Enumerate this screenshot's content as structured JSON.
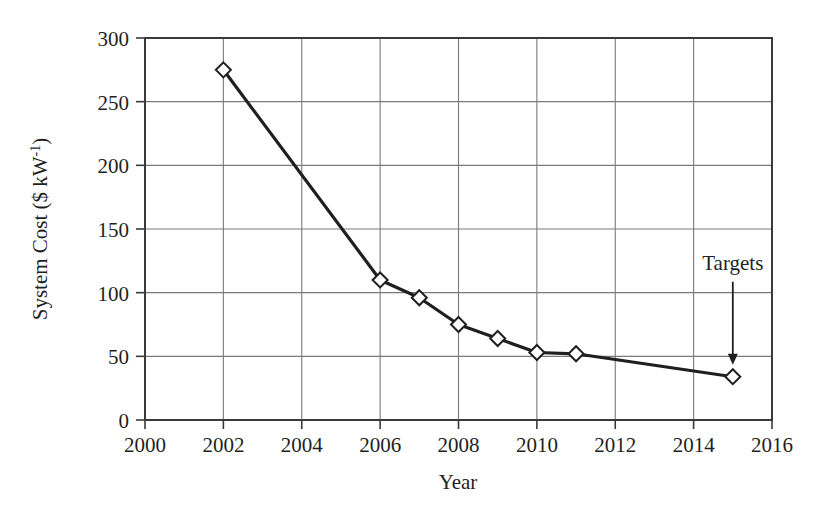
{
  "figure": {
    "background_color": "#ffffff",
    "ink_color": "#1f1f1f",
    "grid_color": "#7a7a7a",
    "frame_color": "#3a3a3a"
  },
  "chart_data": {
    "type": "line",
    "title": "",
    "xlabel": "Year",
    "ylabel_text": "System Cost ($ kW",
    "ylabel_sup": "-1",
    "ylabel_tail": ")",
    "ylabel_full": "System Cost ($ kW⁻¹)",
    "xlim": [
      2000,
      2016
    ],
    "ylim": [
      0,
      300
    ],
    "xticks": [
      2000,
      2002,
      2004,
      2006,
      2008,
      2010,
      2012,
      2014,
      2016
    ],
    "xtick_labels": [
      "2000",
      "2002",
      "2004",
      "2006",
      "2008",
      "2010",
      "2012",
      "2014",
      "2016"
    ],
    "yticks": [
      0,
      50,
      100,
      150,
      200,
      250,
      300
    ],
    "ytick_labels": [
      "0",
      "50",
      "100",
      "150",
      "200",
      "250",
      "300"
    ],
    "grid": "both",
    "legend": "none",
    "marker": "diamond-open",
    "line_color": "#1f1f1f",
    "x": [
      2002,
      2006,
      2007,
      2008,
      2009,
      2010,
      2011,
      2015
    ],
    "values": [
      275,
      110,
      96,
      75,
      64,
      53,
      52,
      34
    ],
    "series": [
      {
        "name": "System Cost",
        "points": [
          {
            "x": 2002,
            "y": 275
          },
          {
            "x": 2006,
            "y": 110
          },
          {
            "x": 2007,
            "y": 96
          },
          {
            "x": 2008,
            "y": 75
          },
          {
            "x": 2009,
            "y": 64
          },
          {
            "x": 2010,
            "y": 53
          },
          {
            "x": 2011,
            "y": 52
          },
          {
            "x": 2015,
            "y": 34
          }
        ]
      }
    ],
    "annotations": [
      {
        "text": "Targets",
        "x": 2015,
        "y": 34,
        "arrow": "down",
        "label_x": 2015,
        "label_y": 118
      }
    ]
  }
}
